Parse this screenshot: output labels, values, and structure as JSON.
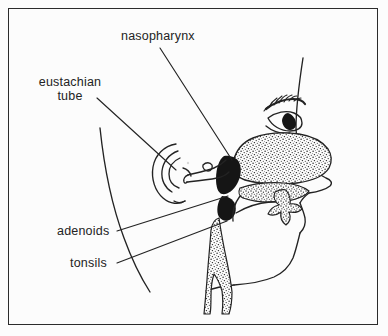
{
  "figure": {
    "kind": "anatomical-line-drawing",
    "background_color": "#fcfcfc",
    "ink_color": "#232323",
    "frame": {
      "color": "#2b2b2b",
      "inset_px": 8
    }
  },
  "labels": {
    "nasopharynx": "nasopharynx",
    "eustachian_line1": "eustachian",
    "eustachian_line2": "tube",
    "adenoids": "adenoids",
    "tonsils": "tonsils"
  },
  "structures": [
    {
      "name": "head-profile",
      "description": "forehead, nose, lips, chin and jaw outline"
    },
    {
      "name": "ear",
      "description": "outer ear with concentric helix curves"
    },
    {
      "name": "eyebrow",
      "description": "hatched dark eyebrow"
    },
    {
      "name": "eye",
      "description": "almond eye with solid pupil"
    },
    {
      "name": "nasal-cavity",
      "description": "large stippled turbinate region"
    },
    {
      "name": "nasopharynx-cavity",
      "description": "solid black airway behind nasal cavity"
    },
    {
      "name": "soft-palate",
      "description": "stippled palate arch above tongue"
    },
    {
      "name": "tongue",
      "description": "tongue body inside mouth"
    },
    {
      "name": "pharyngeal-wall",
      "description": "stippled posterior throat wall descending to neck"
    },
    {
      "name": "eustachian-tube",
      "description": "tube running from ear to nasopharynx"
    },
    {
      "name": "neck-contour",
      "description": "back of head and neck curve"
    }
  ],
  "leader_lines": [
    {
      "for": "nasopharynx",
      "from": [
        160,
        48
      ],
      "to": [
        232,
        160
      ]
    },
    {
      "for": "eustachian tube",
      "from": [
        97,
        98
      ],
      "to": [
        172,
        166
      ]
    },
    {
      "for": "adenoids",
      "from": [
        117,
        231
      ],
      "to": [
        227,
        196
      ]
    },
    {
      "for": "tonsils",
      "from": [
        117,
        263
      ],
      "to": [
        226,
        221
      ]
    }
  ]
}
